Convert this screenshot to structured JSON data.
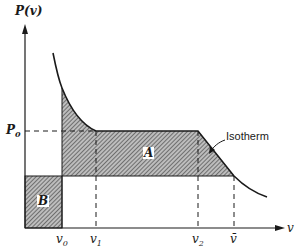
{
  "figure": {
    "y_axis_label": "P(v)",
    "x_axis_label": "v",
    "p0_label": "P",
    "p0_sub": "0",
    "region_a_label": "A",
    "region_b_label": "B",
    "isotherm_label": "Isotherm",
    "ticks": [
      {
        "base": "v",
        "sub": "0",
        "x": 62
      },
      {
        "base": "v",
        "sub": "1",
        "x": 96
      },
      {
        "base": "v",
        "sub": "2",
        "x": 198
      },
      {
        "base": "v̄",
        "sub": "",
        "x": 234
      }
    ],
    "colors": {
      "ink": "#1a1a1a",
      "hatch": "#555555",
      "background": "#ffffff"
    }
  }
}
